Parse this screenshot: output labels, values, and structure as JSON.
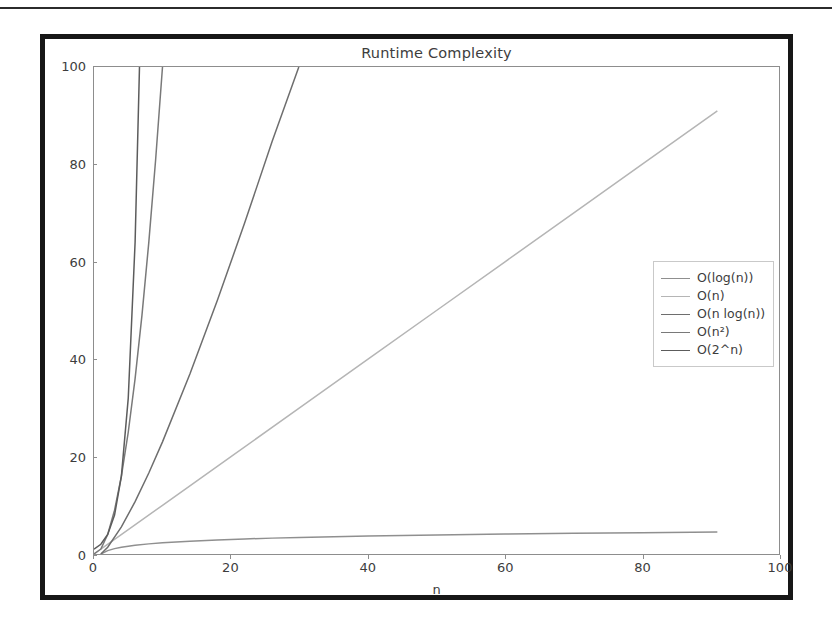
{
  "page": {
    "background": "#ffffff",
    "frame_border_color": "#171717",
    "top_rule_color": "#2b2b2b"
  },
  "chart_data": {
    "type": "line",
    "title": "Runtime Complexity",
    "xlabel": "n",
    "ylabel": "",
    "xlim": [
      0,
      100
    ],
    "ylim": [
      0,
      100
    ],
    "xticks": [
      0,
      20,
      40,
      60,
      80,
      100
    ],
    "yticks": [
      0,
      20,
      40,
      60,
      80,
      100
    ],
    "grid": false,
    "legend_position": "center right",
    "axes_color": "#8d8d8d",
    "text_color": "#3d3d3d",
    "series": [
      {
        "name": "O(log(n))",
        "label_html": "O(log(n))",
        "color": "#8f8f8f",
        "x": [
          1,
          2,
          3,
          4,
          5,
          6,
          8,
          10,
          14,
          18,
          22,
          26,
          30,
          40,
          50,
          60,
          70,
          80,
          91
        ],
        "values": [
          0,
          0.69,
          1.1,
          1.39,
          1.61,
          1.79,
          2.08,
          2.3,
          2.64,
          2.89,
          3.09,
          3.26,
          3.4,
          3.69,
          3.91,
          4.09,
          4.25,
          4.38,
          4.51
        ]
      },
      {
        "name": "O(n)",
        "label_html": "O(n)",
        "color": "#b5b5b5",
        "x": [
          1,
          10,
          20,
          30,
          40,
          50,
          60,
          70,
          80,
          91
        ],
        "values": [
          1,
          10,
          20,
          30,
          40,
          50,
          60,
          70,
          80,
          91
        ]
      },
      {
        "name": "O(n log(n))",
        "label_html": "O(n log(n))",
        "color": "#6e6e6e",
        "x": [
          1,
          2,
          4,
          6,
          8,
          10,
          14,
          18,
          22,
          26,
          29.9
        ],
        "values": [
          0,
          1.39,
          5.55,
          10.75,
          16.64,
          23.03,
          36.95,
          52.03,
          68.0,
          84.7,
          100
        ]
      },
      {
        "name": "O(n²)",
        "label_html": "O(n<sup>2</sup>)",
        "color": "#797979",
        "x": [
          0,
          1,
          2,
          3,
          4,
          5,
          6,
          7,
          8,
          9,
          10
        ],
        "values": [
          0,
          1,
          4,
          9,
          16,
          25,
          36,
          49,
          64,
          81,
          100
        ]
      },
      {
        "name": "O(2^n)",
        "label_html": "O(2^n)",
        "color": "#5c5c5c",
        "x": [
          0,
          1,
          2,
          3,
          4,
          5,
          6,
          6.64
        ],
        "values": [
          1,
          2,
          4,
          8,
          16,
          32,
          64,
          100
        ]
      }
    ]
  },
  "legend": {
    "entries": [
      {
        "label": "O(log(n))",
        "color": "#8f8f8f"
      },
      {
        "label": "O(n)",
        "color": "#b5b5b5"
      },
      {
        "label": "O(n log(n))",
        "color": "#6e6e6e"
      },
      {
        "label": "O(n²)",
        "color": "#797979"
      },
      {
        "label": "O(2^n)",
        "color": "#5c5c5c"
      }
    ]
  }
}
